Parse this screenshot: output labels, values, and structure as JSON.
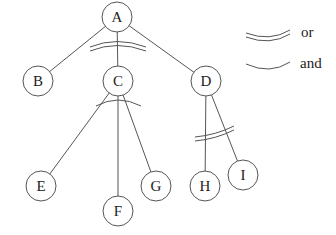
{
  "diagram": {
    "title": "",
    "nodes": [
      {
        "id": "A",
        "label": "A",
        "x": 117,
        "y": 17
      },
      {
        "id": "B",
        "label": "B",
        "x": 38,
        "y": 81
      },
      {
        "id": "C",
        "label": "C",
        "x": 118,
        "y": 81
      },
      {
        "id": "D",
        "label": "D",
        "x": 206,
        "y": 81
      },
      {
        "id": "E",
        "label": "E",
        "x": 41,
        "y": 186
      },
      {
        "id": "F",
        "label": "F",
        "x": 118,
        "y": 211
      },
      {
        "id": "G",
        "label": "G",
        "x": 156,
        "y": 186
      },
      {
        "id": "H",
        "label": "H",
        "x": 205,
        "y": 186
      },
      {
        "id": "I",
        "label": "I",
        "x": 243,
        "y": 175
      }
    ],
    "edges": [
      {
        "from": "A",
        "to": "B"
      },
      {
        "from": "A",
        "to": "C"
      },
      {
        "from": "A",
        "to": "D"
      },
      {
        "from": "C",
        "to": "E"
      },
      {
        "from": "C",
        "to": "F"
      },
      {
        "from": "C",
        "to": "G"
      },
      {
        "from": "D",
        "to": "H"
      },
      {
        "from": "D",
        "to": "I"
      }
    ],
    "groups": [
      {
        "parent": "A",
        "type": "or",
        "children": [
          "B",
          "C",
          "D"
        ]
      },
      {
        "parent": "C",
        "type": "and",
        "children": [
          "E",
          "F",
          "G"
        ]
      },
      {
        "parent": "D",
        "type": "or",
        "children": [
          "H",
          "I"
        ]
      }
    ],
    "legend": {
      "or_label": "or",
      "and_label": "and"
    },
    "colors": {
      "stroke": "#555555",
      "text": "#222222",
      "background": "#ffffff"
    }
  }
}
